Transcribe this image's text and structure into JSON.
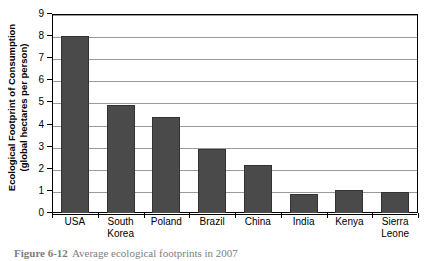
{
  "chart_data": {
    "type": "bar",
    "title": "",
    "xlabel": "",
    "ylabel": "Ecological Footprint of Consumption (global hectares per person)",
    "ylabel_line1": "Ecological Footprint of Consumption",
    "ylabel_line2": "(global hectares per person)",
    "categories": [
      "USA",
      "South Korea",
      "Poland",
      "Brazil",
      "China",
      "India",
      "Kenya",
      "Sierra Leone"
    ],
    "category_lines": [
      {
        "l1": "USA",
        "l2": ""
      },
      {
        "l1": "South",
        "l2": "Korea"
      },
      {
        "l1": "Poland",
        "l2": ""
      },
      {
        "l1": "Brazil",
        "l2": ""
      },
      {
        "l1": "China",
        "l2": ""
      },
      {
        "l1": "India",
        "l2": ""
      },
      {
        "l1": "Kenya",
        "l2": ""
      },
      {
        "l1": "Sierra",
        "l2": "Leone"
      }
    ],
    "values": [
      8.0,
      4.9,
      4.35,
      2.9,
      2.15,
      0.85,
      1.05,
      0.95
    ],
    "ylim": [
      0,
      9
    ],
    "ytick_step": 1,
    "yticks": [
      9,
      8,
      7,
      6,
      5,
      4,
      3,
      2,
      1,
      0
    ],
    "grid": true,
    "legend": false,
    "bar_color": "#4a4a4a",
    "bar_edge_color": "#333333",
    "gridline_color": "#9a9a9a",
    "axis_color": "#000000"
  },
  "caption": {
    "number": "Figure 6-12",
    "text": "Average ecological footprints in 2007"
  }
}
